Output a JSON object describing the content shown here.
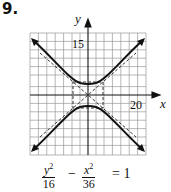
{
  "problem_number": "9.",
  "axes": {
    "x_label": "x",
    "y_label": "y",
    "x_tick_label": "20",
    "y_tick_label": "15"
  },
  "equation": {
    "term1_numerator_var": "y",
    "term1_numerator_exp": "2",
    "term1_denominator": "16",
    "operator": "−",
    "term2_numerator_var": "x",
    "term2_numerator_exp": "2",
    "term2_denominator": "36",
    "equals": "= 1"
  },
  "graph": {
    "type": "hyperbola",
    "orientation": "vertical",
    "a": 4,
    "b": 6,
    "center": [
      0,
      0
    ],
    "vertices": [
      [
        0,
        4
      ],
      [
        0,
        -4
      ]
    ],
    "asymptotes": [
      "y = (2/3)x",
      "y = -(2/3)x"
    ],
    "fundamental_rectangle": {
      "x": [
        -6,
        6
      ],
      "y": [
        -4,
        4
      ]
    },
    "colors": {
      "curve": "#111111",
      "grid": "#9a9a9a",
      "axis": "#111111",
      "dashed": "#222222"
    }
  }
}
